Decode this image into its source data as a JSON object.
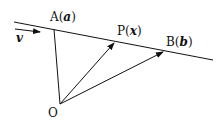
{
  "diagram": {
    "points": {
      "A": {
        "name": "A",
        "vector": "a"
      },
      "P": {
        "name": "P",
        "vector": "x"
      },
      "B": {
        "name": "B",
        "vector": "b"
      },
      "O": {
        "name": "O"
      }
    },
    "direction_vector": "v",
    "colors": {
      "stroke": "#111111",
      "background": "#ffffff"
    }
  }
}
